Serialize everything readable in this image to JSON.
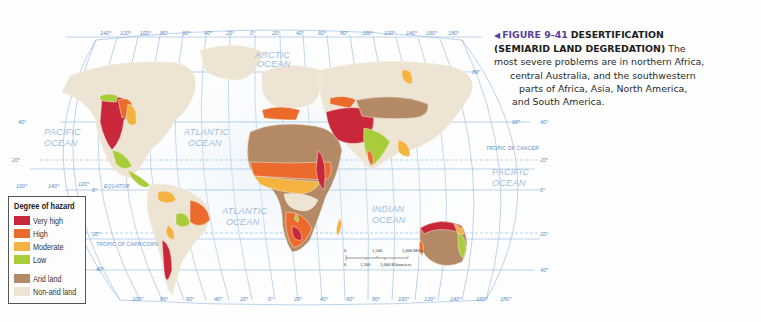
{
  "caption": {
    "arrow_icon": "◀",
    "figure_number": "FIGURE 9-41",
    "title_line1": "DESERTIFICATION",
    "title_line2": "(SEMIARID LAND DEGREDATION)",
    "text_line2_tail": "The",
    "text_line3": "most severe problems are in northern Africa,",
    "text_line4": "central Australia, and the southwestern",
    "text_line5": "parts of Africa, Asia, North America,",
    "text_line6": "and South America."
  },
  "legend": {
    "title": "Degree of hazard",
    "items": [
      {
        "label": "Very high",
        "color": "#c9273a"
      },
      {
        "label": "High",
        "color": "#ec6a2c"
      },
      {
        "label": "Moderate",
        "color": "#f4b23f"
      },
      {
        "label": "Low",
        "color": "#a9cc3a"
      },
      {
        "label": "Arid land",
        "color": "#b48a66"
      },
      {
        "label": "Non-arid land",
        "color": "#ede4d3"
      }
    ]
  },
  "map": {
    "top_longitudes": [
      "140°",
      "120°",
      "100°",
      "80°",
      "60°",
      "40°",
      "20°",
      "0°",
      "20°",
      "40°",
      "60°",
      "80°",
      "100°",
      "120°",
      "140°",
      "160°",
      "180°"
    ],
    "bottom_longitudes": [
      "100°",
      "80°",
      "60°",
      "40°",
      "20°",
      "0°",
      "20°",
      "40°",
      "60°",
      "80°",
      "100°",
      "120°",
      "140°",
      "160°",
      "180°"
    ],
    "left_longitudes": [
      "160°",
      "140°",
      "120°"
    ],
    "left_latitudes": {
      "lat40n": "40°",
      "lat20n": "20°",
      "lat0": "0°",
      "lat20s": "20°",
      "lat40s": "40°"
    },
    "right_latitudes": {
      "lat80n": "80°",
      "lat60n": "60°",
      "lat40n": "40°",
      "lat20n": "20°",
      "lat0": "0°",
      "lat20s": "20°",
      "lat40s": "40°"
    },
    "oceans": {
      "arctic": [
        "ARCTIC",
        "OCEAN"
      ],
      "pacific_west": [
        "PACIFIC",
        "OCEAN"
      ],
      "atlantic_north": [
        "ATLANTIC",
        "OCEAN"
      ],
      "atlantic_south": [
        "ATLANTIC",
        "OCEAN"
      ],
      "indian": [
        "INDIAN",
        "OCEAN"
      ],
      "pacific_east": [
        "PACIFIC",
        "OCEAN"
      ]
    },
    "lines": {
      "equator": "EQUATOR",
      "tropic_cancer": "TROPIC OF CANCER",
      "tropic_capricorn": "TROPIC OF CAPRICORN"
    },
    "scale": {
      "miles": [
        "0",
        "1,500",
        "3,000 Miles"
      ],
      "km": [
        "0",
        "1,500",
        "3,000 Kilometers"
      ]
    }
  }
}
